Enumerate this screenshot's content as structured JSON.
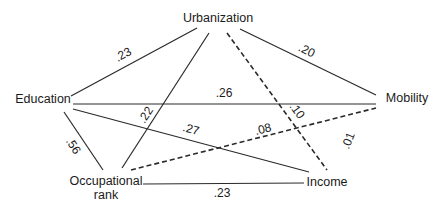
{
  "diagram": {
    "type": "path-correlation-network",
    "nodes": {
      "urbanization": {
        "label": "Urbanization",
        "x": 218,
        "y": 22
      },
      "education": {
        "label": "Education",
        "x": 43,
        "y": 103
      },
      "mobility": {
        "label": "Mobility",
        "x": 407,
        "y": 102
      },
      "occupational_line1": {
        "label": "Occupational",
        "x": 106,
        "y": 185
      },
      "occupational_line2": {
        "label": "rank",
        "x": 106,
        "y": 199
      },
      "income": {
        "label": "Income",
        "x": 327,
        "y": 186
      }
    },
    "edges": [
      {
        "id": "urbanization-education",
        "from": "Urbanization",
        "to": "Education",
        "value": ".23",
        "style": "solid",
        "x1": 197,
        "y1": 28,
        "x2": 71,
        "y2": 96,
        "lx": 125,
        "ly": 58,
        "angle": -28
      },
      {
        "id": "urbanization-mobility",
        "from": "Urbanization",
        "to": "Mobility",
        "value": ".20",
        "style": "solid",
        "x1": 240,
        "y1": 29,
        "x2": 376,
        "y2": 95,
        "lx": 305,
        "ly": 54,
        "angle": 26
      },
      {
        "id": "urbanization-occupational",
        "from": "Urbanization",
        "to": "Occupational rank",
        "value": ".22",
        "style": "solid",
        "x1": 209,
        "y1": 33,
        "x2": 122,
        "y2": 168,
        "lx": 149,
        "ly": 117,
        "angle": -57
      },
      {
        "id": "urbanization-income",
        "from": "Urbanization",
        "to": "Income",
        "value": ".10",
        "style": "dashed",
        "x1": 227,
        "y1": 33,
        "x2": 327,
        "y2": 170,
        "lx": 294,
        "ly": 113,
        "angle": 54
      },
      {
        "id": "education-mobility",
        "from": "Education",
        "to": "Mobility",
        "value": ".26",
        "style": "solid",
        "x1": 73,
        "y1": 104,
        "x2": 376,
        "y2": 104,
        "lx": 224,
        "ly": 97,
        "angle": 0
      },
      {
        "id": "education-income",
        "from": "Education",
        "to": "Income",
        "value": ".27",
        "style": "solid",
        "x1": 73,
        "y1": 109,
        "x2": 309,
        "y2": 172,
        "lx": 190,
        "ly": 133,
        "angle": 15
      },
      {
        "id": "education-occupational",
        "from": "Education",
        "to": "Occupational rank",
        "value": ".56",
        "style": "solid",
        "x1": 64,
        "y1": 112,
        "x2": 103,
        "y2": 170,
        "lx": 70,
        "ly": 148,
        "angle": 57
      },
      {
        "id": "occupational-mobility",
        "from": "Occupational rank",
        "to": "Mobility",
        "value": ".08",
        "style": "dashed",
        "x1": 131,
        "y1": 170,
        "x2": 376,
        "y2": 108,
        "lx": 264,
        "ly": 133,
        "angle": -14
      },
      {
        "id": "mobility-income",
        "from": "Mobility",
        "to": "Income",
        "value": ".01",
        "style": "none",
        "lx": 352,
        "ly": 142,
        "angle": -68
      },
      {
        "id": "occupational-income",
        "from": "Occupational rank",
        "to": "Income",
        "value": ".23",
        "style": "solid",
        "x1": 143,
        "y1": 184,
        "x2": 304,
        "y2": 183,
        "lx": 222,
        "ly": 197,
        "angle": 0
      }
    ],
    "colors": {
      "line": "#2a2a2a",
      "text": "#1a1a1a",
      "background": "#ffffff"
    }
  }
}
